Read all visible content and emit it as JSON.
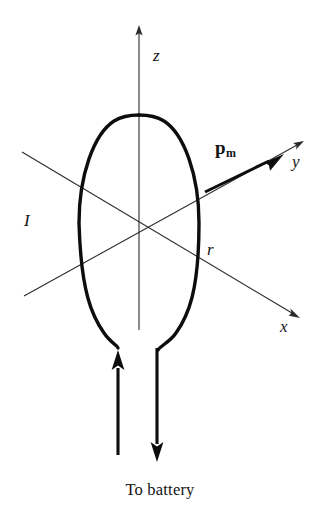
{
  "figure": {
    "type": "physics-diagram",
    "background_color": "#ffffff",
    "ink_color": "#0d0d0d",
    "axis_color": "#2b2b2b",
    "axes": [
      {
        "id": "z",
        "label": "z",
        "direction": "up",
        "arrow": true
      },
      {
        "id": "y",
        "label": "y",
        "direction": "upper-right",
        "arrow": true
      },
      {
        "id": "x",
        "label": "x",
        "direction": "lower-right",
        "arrow": true
      }
    ],
    "labels": {
      "z_axis": "z",
      "y_axis": "y",
      "x_axis": "x",
      "current": "I",
      "radius": "r",
      "moment_symbol": "p",
      "moment_subscript": "m"
    },
    "caption": "To battery",
    "loop": {
      "shape": "ellipse",
      "center_x": 139,
      "center_y": 223,
      "radius_x": 60,
      "radius_y": 105,
      "stroke_width": 3.4
    },
    "leads": [
      {
        "id": "left-lead",
        "x": 118,
        "current_direction": "up",
        "arrow": true
      },
      {
        "id": "right-lead",
        "x": 157,
        "current_direction": "down",
        "arrow": true
      }
    ],
    "moment_vector": {
      "name": "magnetic dipole moment",
      "from_x": 205,
      "from_y": 192,
      "to_x": 282,
      "to_y": 155,
      "bold": true
    }
  }
}
